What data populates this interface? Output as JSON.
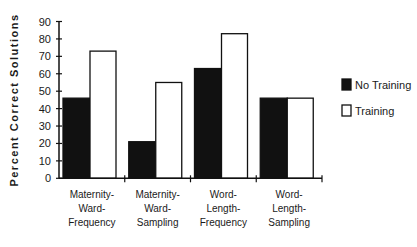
{
  "chart_data": {
    "type": "bar",
    "title": "",
    "xlabel": "",
    "ylabel": "Percent Correct Solutions",
    "ylim": [
      0,
      90
    ],
    "yticks": [
      0,
      10,
      20,
      30,
      40,
      50,
      60,
      70,
      80,
      90
    ],
    "categories": [
      [
        "Maternity-",
        "Ward-",
        "Frequency"
      ],
      [
        "Maternity-",
        "Ward-",
        "Sampling"
      ],
      [
        "Word-",
        "Length-",
        "Frequency"
      ],
      [
        "Word-",
        "Length-",
        "Sampling"
      ]
    ],
    "category_names": [
      "Maternity-Ward-Frequency",
      "Maternity-Ward-Sampling",
      "Word-Length-Frequency",
      "Word-Length-Sampling"
    ],
    "series": [
      {
        "name": "No Training",
        "color": "#111111",
        "values": [
          46,
          21,
          63,
          46
        ]
      },
      {
        "name": "Training",
        "color": "#ffffff",
        "values": [
          73,
          55,
          83,
          46
        ]
      }
    ],
    "grid": false,
    "legend_position": "right"
  }
}
